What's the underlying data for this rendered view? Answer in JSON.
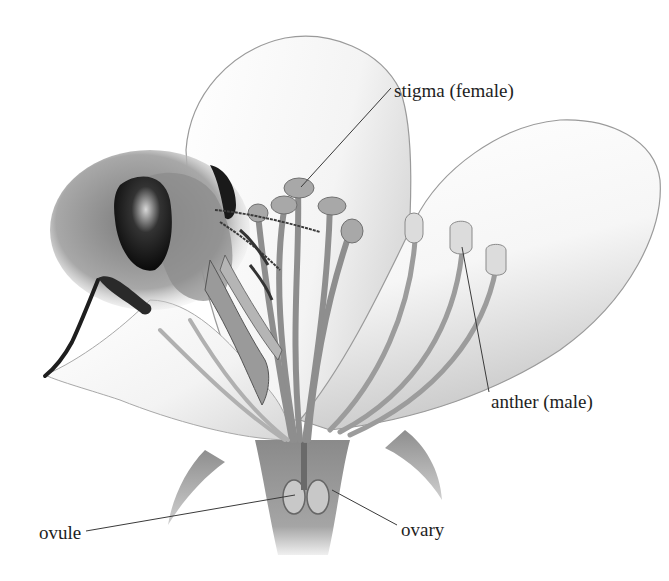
{
  "diagram": {
    "labels": [
      {
        "id": "stigma",
        "text": "stigma (female)"
      },
      {
        "id": "anther",
        "text": "anther (male)"
      },
      {
        "id": "ovule",
        "text": "ovule"
      },
      {
        "id": "ovary",
        "text": "ovary"
      }
    ],
    "colors": {
      "background": "#ffffff",
      "label_text": "#1e1e1e",
      "leader_line": "#3a3a3a",
      "petal_fill": "#f4f4f4",
      "petal_outline": "#9a9a9a",
      "stamen": "#9c9c9c",
      "bee_eye": "#111111",
      "bee_fur": "#6e6e6e"
    }
  }
}
